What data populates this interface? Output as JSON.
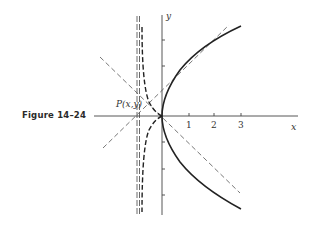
{
  "figure": {
    "caption": "Figure 14–24",
    "point_label": "P(x,y)",
    "axis_x_label": "x",
    "axis_y_label": "y",
    "x_ticks": [
      "1",
      "2",
      "3"
    ]
  },
  "colors": {
    "ink": "#2a2a2a",
    "background": "#ffffff"
  },
  "curves": [
    {
      "name": "parabola",
      "equation": "y^2 = 4x",
      "style": "solid"
    },
    {
      "name": "reflected-curve",
      "style": "dashed",
      "asymptote": "x = -1"
    },
    {
      "name": "tangent-line",
      "style": "dashed"
    },
    {
      "name": "diagonal-line",
      "style": "dashed"
    },
    {
      "name": "asymptote",
      "style": "dashed",
      "x": -1
    }
  ]
}
